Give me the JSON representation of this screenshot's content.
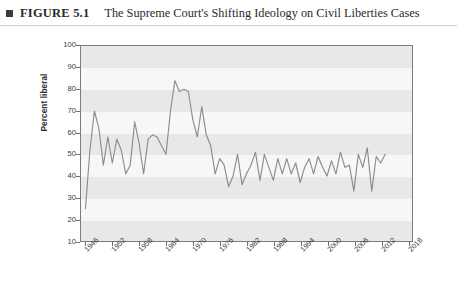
{
  "caption": {
    "marker_icon": "square-bullet-icon",
    "figure_label": "FIGURE 5.1",
    "title": "The Supreme Court's Shifting Ideology on Civil Liberties Cases"
  },
  "colors": {
    "line": "#8c8c8c",
    "frame": "#7c7c7c",
    "band_light": "#f7f7f7",
    "band_dark": "#e8e8e8",
    "text": "#2e2e2e"
  },
  "footer": {
    "cropped_text": ""
  },
  "chart_data": {
    "type": "line",
    "title": "The Supreme Court's Shifting Ideology on Civil Liberties Cases",
    "xlabel": "",
    "ylabel": "Percent liberal",
    "xlim": [
      1945,
      2019
    ],
    "ylim": [
      10,
      100
    ],
    "grid": "horizontal-alternating-bands",
    "legend": "none",
    "x_tick_labels": [
      "1946",
      "1952",
      "1958",
      "1964",
      "1970",
      "1976",
      "1982",
      "1988",
      "1994",
      "2000",
      "2006",
      "2012",
      "2018"
    ],
    "y_tick_labels": [
      "10",
      "20",
      "30",
      "40",
      "50",
      "60",
      "70",
      "80",
      "90",
      "100"
    ],
    "series": [
      {
        "name": "Percent liberal",
        "x": [
          1946,
          1947,
          1948,
          1949,
          1950,
          1951,
          1952,
          1953,
          1954,
          1955,
          1956,
          1957,
          1958,
          1959,
          1960,
          1961,
          1962,
          1963,
          1964,
          1965,
          1966,
          1967,
          1968,
          1969,
          1970,
          1971,
          1972,
          1973,
          1974,
          1975,
          1976,
          1977,
          1978,
          1979,
          1980,
          1981,
          1982,
          1983,
          1984,
          1985,
          1986,
          1987,
          1988,
          1989,
          1990,
          1991,
          1992,
          1993,
          1994,
          1995,
          1996,
          1997,
          1998,
          1999,
          2000,
          2001,
          2002,
          2003,
          2004,
          2005,
          2006,
          2007,
          2008,
          2009,
          2010,
          2011,
          2012,
          2013
        ],
        "values": [
          25,
          52,
          70,
          62,
          45,
          58,
          46,
          57,
          52,
          41,
          45,
          65,
          55,
          41,
          57,
          59,
          58,
          54,
          50,
          70,
          84,
          79,
          80,
          79,
          66,
          58,
          72,
          59,
          54,
          41,
          48,
          45,
          35,
          40,
          50,
          36,
          41,
          45,
          51,
          38,
          50,
          44,
          38,
          48,
          41,
          48,
          41,
          46,
          37,
          44,
          48,
          41,
          49,
          44,
          40,
          47,
          41,
          51,
          44,
          45,
          33,
          50,
          44,
          53,
          33,
          49,
          46,
          50
        ]
      }
    ]
  }
}
